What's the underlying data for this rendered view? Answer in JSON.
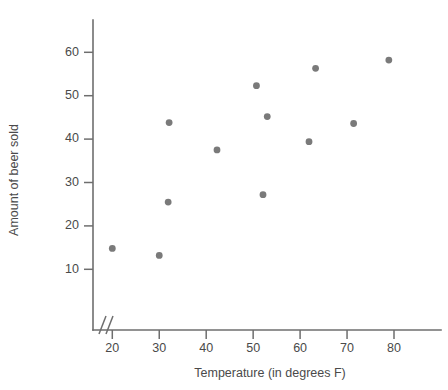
{
  "chart_data": {
    "type": "scatter",
    "title": "",
    "xlabel": "Temperature (in degrees F)",
    "ylabel": "Amount of beer sold",
    "xlim": [
      15,
      85
    ],
    "ylim": [
      5,
      65
    ],
    "xticks": [
      20,
      30,
      40,
      50,
      60,
      70,
      80
    ],
    "xticklabels": [
      "20",
      "30",
      "40",
      "50",
      "60",
      "70",
      "80"
    ],
    "yticks": [
      10,
      20,
      30,
      40,
      50,
      60
    ],
    "yticklabels": [
      "10",
      "20",
      "30",
      "40",
      "50",
      "60"
    ],
    "grid": false,
    "legend": null,
    "axis_break": {
      "axis": "x",
      "symbol": "//",
      "note": "broken x-axis between origin and first tick"
    },
    "marker": {
      "shape": "circle",
      "color": "#7a7a7a",
      "radius": 3.4
    },
    "points": [
      {
        "x": 20.0,
        "y": 14.8
      },
      {
        "x": 30.0,
        "y": 13.2
      },
      {
        "x": 31.9,
        "y": 25.5
      },
      {
        "x": 32.1,
        "y": 43.8
      },
      {
        "x": 42.3,
        "y": 37.5
      },
      {
        "x": 50.7,
        "y": 52.3
      },
      {
        "x": 52.1,
        "y": 27.2
      },
      {
        "x": 53.0,
        "y": 45.2
      },
      {
        "x": 61.9,
        "y": 39.4
      },
      {
        "x": 63.3,
        "y": 56.3
      },
      {
        "x": 71.4,
        "y": 43.6
      },
      {
        "x": 78.9,
        "y": 58.2
      }
    ]
  },
  "axes": {
    "x_label": "Temperature (in degrees F)",
    "y_label": "Amount of beer sold"
  }
}
